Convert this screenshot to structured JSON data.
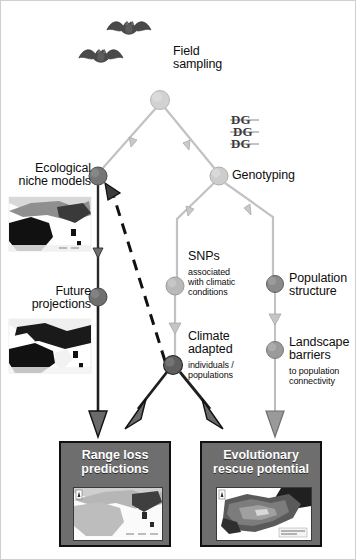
{
  "figure": {
    "background_color": "#ffffff"
  },
  "palette": {
    "node_light": "#c9c9c9",
    "node_mid": "#b3b3b3",
    "node_dark": "#6b6b6b",
    "edge_light": "#b9b9b9",
    "edge_dark": "#1a1a1a",
    "box_fill": "#6e6e6e",
    "box_border": "#111111",
    "box_text": "#ffffff",
    "label_text": "#0d0d0d"
  },
  "nodes": [
    {
      "id": "field-sampling",
      "label": "Field\nsampling",
      "sub": "",
      "tone": "light",
      "x": 159,
      "y": 99,
      "r": 9.5
    },
    {
      "id": "ecological-niche",
      "label": "Ecological\nniche models",
      "sub": "",
      "tone": "dark",
      "x": 97,
      "y": 175,
      "r": 9.0
    },
    {
      "id": "genotyping",
      "label": "Genotyping",
      "sub": "",
      "tone": "light",
      "x": 218,
      "y": 175,
      "r": 9.0
    },
    {
      "id": "future-projections",
      "label": "Future\nprojections",
      "sub": "",
      "tone": "dark",
      "x": 97,
      "y": 296,
      "r": 9.0
    },
    {
      "id": "snps-climatic",
      "label": "SNPs",
      "sub": "associated\nwith climatic\nconditions",
      "tone": "mid",
      "x": 172,
      "y": 285,
      "r": 9.0
    },
    {
      "id": "population-structure",
      "label": "Population\nstructure",
      "sub": "",
      "tone": "dark",
      "x": 274,
      "y": 283,
      "r": 8.5
    },
    {
      "id": "climate-adapted",
      "label": "Climate\nadapted",
      "sub": "individuals /\npopulations",
      "tone": "dark",
      "x": 172,
      "y": 364,
      "r": 9.5
    },
    {
      "id": "landscape-barriers",
      "label": "Landscape\nbarriers",
      "sub": "to population\nconnectivity",
      "tone": "mid",
      "x": 274,
      "y": 349,
      "r": 8.5
    }
  ],
  "labels": [
    {
      "id": "field-sampling-label",
      "text": "Field\nsampling",
      "align": "left",
      "x": 172,
      "y": 48,
      "size": "main"
    },
    {
      "id": "ecological-niche-label",
      "text": "Ecological\nniche models",
      "align": "right",
      "x": 6,
      "y": 162,
      "size": "main",
      "w": 84
    },
    {
      "id": "genotyping-label",
      "text": "Genotyping",
      "align": "left",
      "x": 231,
      "y": 168,
      "size": "main"
    },
    {
      "id": "future-projections-label",
      "text": "Future\nprojections",
      "align": "right",
      "x": 6,
      "y": 285,
      "size": "main",
      "w": 84
    },
    {
      "id": "snps-label",
      "text": "SNPs",
      "align": "left",
      "x": 186,
      "y": 250,
      "size": "main"
    },
    {
      "id": "snps-sublabel",
      "text": "associated\nwith climatic\nconditions",
      "align": "left",
      "x": 186,
      "y": 266,
      "size": "sub"
    },
    {
      "id": "population-structure-label",
      "text": "Population\nstructure",
      "align": "left",
      "x": 288,
      "y": 272,
      "size": "main"
    },
    {
      "id": "climate-adapted-label",
      "text": "Climate\nadapted",
      "align": "left",
      "x": 186,
      "y": 330,
      "size": "main"
    },
    {
      "id": "climate-adapted-sublabel",
      "text": "individuals /\npopulations",
      "align": "left",
      "x": 186,
      "y": 360,
      "size": "sub"
    },
    {
      "id": "landscape-barriers-label",
      "text": "Landscape\nbarriers",
      "align": "left",
      "x": 288,
      "y": 336,
      "size": "main"
    },
    {
      "id": "landscape-barriers-sublabel",
      "text": "to population\nconnectivity",
      "align": "left",
      "x": 288,
      "y": 366,
      "size": "sub"
    }
  ],
  "outcomes": [
    {
      "id": "range-loss",
      "title": "Range loss\npredictions",
      "x": 58,
      "y": 440,
      "w": 112,
      "h": 106,
      "map_caption": "species distribution map"
    },
    {
      "id": "evolutionary-rescue",
      "title": "Evolutionary\nrescue potential",
      "x": 199,
      "y": 440,
      "w": 122,
      "h": 106,
      "map_caption": "adaptive potential map"
    }
  ],
  "thumbnails": [
    {
      "id": "niche-model-map",
      "caption": "present climatic suitability map",
      "x": 8,
      "y": 196,
      "w": 82,
      "h": 54
    },
    {
      "id": "future-projection-map",
      "caption": "future climatic suitability map",
      "x": 8,
      "y": 318,
      "w": 82,
      "h": 54
    }
  ],
  "icons": [
    {
      "id": "bat-icon-1",
      "name": "bat-icon",
      "x": 104,
      "y": 16
    },
    {
      "id": "bat-icon-2",
      "name": "bat-icon",
      "x": 76,
      "y": 44
    },
    {
      "id": "dna-icon",
      "name": "dna-sequence-icon",
      "x": 230,
      "y": 112
    }
  ],
  "edges": [
    {
      "id": "sampling-to-niche",
      "from": "field-sampling",
      "to": "ecological-niche",
      "style": "light-arrow"
    },
    {
      "id": "sampling-to-genotyping",
      "from": "field-sampling",
      "to": "genotyping",
      "style": "light-arrow"
    },
    {
      "id": "niche-to-future",
      "from": "ecological-niche",
      "to": "future-projections",
      "style": "dark-line"
    },
    {
      "id": "genotyping-to-snps",
      "from": "genotyping",
      "to": "snps-climatic",
      "style": "light-arrow"
    },
    {
      "id": "genotyping-to-popstructure",
      "from": "genotyping",
      "to": "population-structure",
      "style": "light-arrow"
    },
    {
      "id": "snps-to-climate-adapted",
      "from": "snps-climatic",
      "to": "climate-adapted",
      "style": "light-arrow"
    },
    {
      "id": "popstructure-to-landscape",
      "from": "population-structure",
      "to": "landscape-barriers",
      "style": "light-arrow"
    },
    {
      "id": "future-to-range-loss",
      "from": "future-projections",
      "to": "range-loss",
      "style": "dark-arrow"
    },
    {
      "id": "climate-adapted-to-range-loss",
      "from": "climate-adapted",
      "to": "range-loss",
      "style": "dark-arrow"
    },
    {
      "id": "climate-adapted-to-rescue",
      "from": "climate-adapted",
      "to": "evolutionary-rescue",
      "style": "dark-arrow"
    },
    {
      "id": "landscape-to-rescue",
      "from": "landscape-barriers",
      "to": "evolutionary-rescue",
      "style": "light-arrow"
    },
    {
      "id": "climate-adapted-feedback",
      "from": "climate-adapted",
      "to": "ecological-niche",
      "style": "dashed-arrow"
    }
  ]
}
